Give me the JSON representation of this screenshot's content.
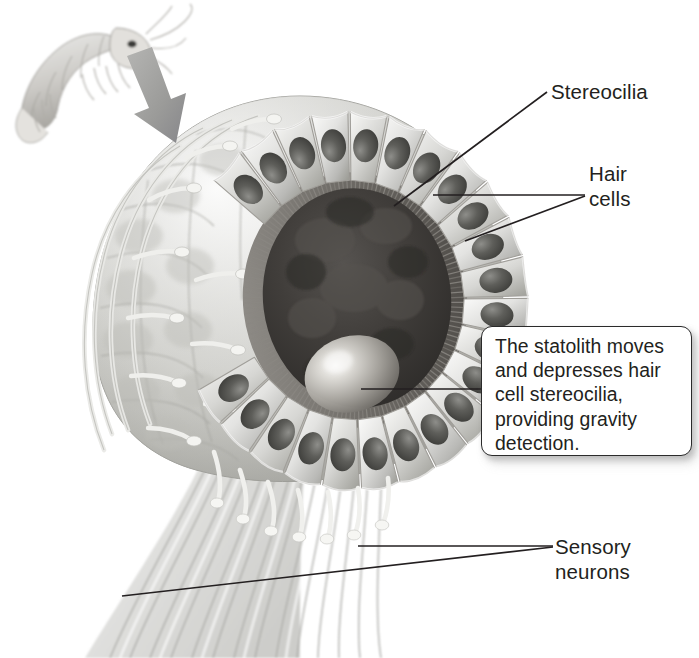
{
  "figure": {
    "organism_inset": "shrimp",
    "style": "grayscale airbrush biological illustration",
    "background_color": "#ffffff",
    "ink_color": "#231f20"
  },
  "labels": {
    "stereocilia": "Stereocilia",
    "hair_cells": "Hair\ncells",
    "sensory_neurons": "Sensory\nneurons"
  },
  "callout": {
    "text": "The statolith moves and depresses hair cell stereocilia, providing gravity detection.",
    "border_color": "#2b2b2b",
    "background_color": "#ffffff"
  },
  "structures": {
    "hair_cell_ring": {
      "name": "hair cells",
      "count_visible": 22,
      "description": "ring of columnar hair cells with dark oval nuclei"
    },
    "stereocilia_fringe": {
      "name": "stereocilia",
      "description": "dense bristle fringe lining the inner cavity wall"
    },
    "statolith": {
      "name": "statolith",
      "description": "pale dense granule resting in the lower cavity"
    },
    "sensory_neuron_bundle": {
      "name": "sensory neurons",
      "description": "bundle of axons sweeping down and to the left"
    },
    "cavity": {
      "name": "statocyst cavity",
      "description": "dark sac interior"
    },
    "pointer_arrow": {
      "name": "magnification arrow",
      "description": "thick gray arrow from the shrimp head to the statocyst"
    }
  },
  "palette": {
    "ink": "#231f20",
    "cell_light": "#f2f2f1",
    "cell_mid": "#c9c9c7",
    "cell_shadow": "#9a9a98",
    "nucleus_dark": "#4a4a48",
    "cavity_dark": "#3a3836",
    "statolith_light": "#dedcd8",
    "nerve_gray": "#d9d9d7",
    "arrow_gray": "#9d9d9b"
  }
}
